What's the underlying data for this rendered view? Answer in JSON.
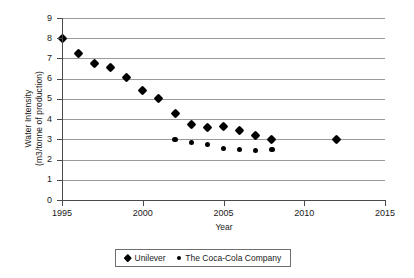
{
  "chart_data": {
    "type": "scatter",
    "title": "",
    "xlabel": "Year",
    "ylabel_lines": [
      "Water Intensity",
      "(m3/tonne of production)"
    ],
    "xlim": [
      1995,
      2015
    ],
    "ylim": [
      0,
      9
    ],
    "xticks": [
      1995,
      2000,
      2005,
      2010,
      2015
    ],
    "yticks": [
      0,
      1,
      2,
      3,
      4,
      5,
      6,
      7,
      8,
      9
    ],
    "grid": "horizontal",
    "legend_position": "bottom",
    "series": [
      {
        "name": "Unilever",
        "marker": "diamond",
        "color": "#000000",
        "points": [
          {
            "x": 1995,
            "y": 8.0
          },
          {
            "x": 1996,
            "y": 7.25
          },
          {
            "x": 1997,
            "y": 6.75
          },
          {
            "x": 1998,
            "y": 6.55
          },
          {
            "x": 1999,
            "y": 6.05
          },
          {
            "x": 2000,
            "y": 5.4
          },
          {
            "x": 2001,
            "y": 5.0
          },
          {
            "x": 2002,
            "y": 4.3
          },
          {
            "x": 2003,
            "y": 3.75
          },
          {
            "x": 2004,
            "y": 3.6
          },
          {
            "x": 2005,
            "y": 3.65
          },
          {
            "x": 2006,
            "y": 3.45
          },
          {
            "x": 2007,
            "y": 3.2
          },
          {
            "x": 2008,
            "y": 3.0
          },
          {
            "x": 2012,
            "y": 3.0
          }
        ]
      },
      {
        "name": "The Coca-Cola Company",
        "marker": "circle",
        "color": "#000000",
        "points": [
          {
            "x": 2002,
            "y": 3.0
          },
          {
            "x": 2003,
            "y": 2.85
          },
          {
            "x": 2004,
            "y": 2.75
          },
          {
            "x": 2005,
            "y": 2.55
          },
          {
            "x": 2006,
            "y": 2.5
          },
          {
            "x": 2007,
            "y": 2.45
          },
          {
            "x": 2008,
            "y": 2.5
          }
        ]
      }
    ]
  }
}
